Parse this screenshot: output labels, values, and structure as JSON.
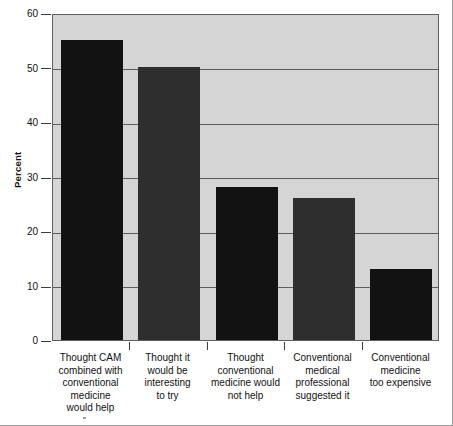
{
  "chart_data": {
    "type": "bar",
    "title": "",
    "xlabel": "",
    "ylabel": "Percent",
    "ylim": [
      0,
      60
    ],
    "yticks": [
      0,
      10,
      20,
      30,
      40,
      50,
      60
    ],
    "ytick_labels": [
      "0",
      "10",
      "20",
      "30",
      "40",
      "50",
      "60"
    ],
    "grid": "horizontal",
    "legend": "none",
    "categories": [
      "Thought CAM combined with conventional medicine would help",
      "Thought it would be interesting to try",
      "Thought conventional medicine would not help",
      "Conventional medical professional suggested it",
      "Conventional medicine too expensive"
    ],
    "category_lines": [
      [
        "Thought CAM",
        "combined with",
        "conventional",
        "medicine",
        "would help"
      ],
      [
        "Thought it",
        "would be",
        "interesting",
        "to try"
      ],
      [
        "Thought",
        "conventional",
        "medicine would",
        "not help"
      ],
      [
        "Conventional",
        "medical",
        "professional",
        "suggested it"
      ],
      [
        "Conventional",
        "medicine",
        "too expensive"
      ]
    ],
    "values": [
      55,
      50,
      28,
      26,
      13
    ],
    "bar_colors": [
      "#121212",
      "#2e2e2e",
      "#121212",
      "#2e2e2e",
      "#121212"
    ],
    "plot_background": "#d5d5d5",
    "axis_color": "#5d5d5d",
    "figure_background": "#ffffff"
  }
}
